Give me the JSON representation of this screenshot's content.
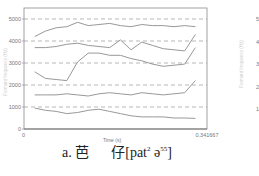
{
  "chart_data": {
    "type": "line",
    "title": "",
    "xlabel": "Time (s)",
    "ylabel": "Formant frequency (Hz)",
    "xlim": [
      0,
      0.341667
    ],
    "ylim": [
      0,
      5500
    ],
    "x_tick_labels": [
      "0",
      "0.341667"
    ],
    "y_ticks": [
      0,
      1000,
      2000,
      3000,
      4000,
      5000
    ],
    "y_tick_labels": [
      "0",
      "1000",
      "2000",
      "3000",
      "4000",
      "5000"
    ],
    "grid": "dashed horizontal at 1000-Hz intervals",
    "legend": "none",
    "x": [
      0.02,
      0.04,
      0.06,
      0.08,
      0.1,
      0.12,
      0.14,
      0.16,
      0.18,
      0.2,
      0.22,
      0.24,
      0.26,
      0.28,
      0.3,
      0.32
    ],
    "series": [
      {
        "name": "F5",
        "values": [
          4200,
          4450,
          4600,
          4650,
          4850,
          4700,
          4750,
          4800,
          4700,
          4650,
          4750,
          4700,
          4700,
          4650,
          4700,
          4650
        ]
      },
      {
        "name": "F4",
        "values": [
          3700,
          3700,
          3750,
          3850,
          3900,
          3800,
          3750,
          3700,
          4050,
          3600,
          3950,
          3800,
          3650,
          3600,
          3550,
          4300
        ]
      },
      {
        "name": "F3",
        "values": [
          2600,
          2300,
          2250,
          2200,
          3050,
          3450,
          3450,
          3350,
          3350,
          3200,
          3100,
          2950,
          2850,
          2900,
          2950,
          3700
        ]
      },
      {
        "name": "F2",
        "values": [
          1550,
          1550,
          1550,
          1600,
          1550,
          1500,
          1600,
          1650,
          1600,
          1550,
          1650,
          1600,
          1550,
          1600,
          1650,
          2200
        ]
      },
      {
        "name": "F1",
        "values": [
          950,
          850,
          800,
          700,
          750,
          850,
          900,
          800,
          700,
          600,
          550,
          550,
          550,
          500,
          500,
          480
        ]
      }
    ]
  },
  "caption": {
    "prefix": "a.",
    "char1": "芭",
    "char2": "仔",
    "ipa_open": "[pat",
    "tone1": "2",
    "ipa_mid": " ə",
    "tone2": "55",
    "ipa_close": "]"
  },
  "secondary_chart": {
    "y_tick_labels": [
      "5",
      "4",
      "3",
      "2",
      "1"
    ],
    "ylabel": "Formant frequency (Hz)"
  }
}
